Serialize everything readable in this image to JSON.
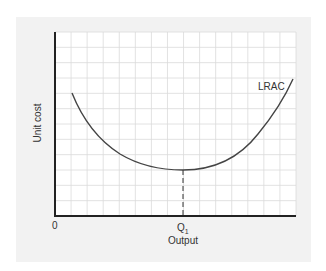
{
  "chart_data": {
    "type": "line",
    "title": "",
    "xlabel": "Output",
    "ylabel": "Unit cost",
    "origin_label": "0",
    "x_tick_labels": [
      {
        "label": "Q",
        "subscript": "1",
        "position": "minimum of LRAC"
      }
    ],
    "grid": true,
    "legend": "none",
    "series": [
      {
        "name": "LRAC",
        "shape": "U-shaped curve",
        "points_normalized": [
          {
            "x": 0.07,
            "y": 0.8
          },
          {
            "x": 0.14,
            "y": 0.62
          },
          {
            "x": 0.2,
            "y": 0.49
          },
          {
            "x": 0.29,
            "y": 0.38
          },
          {
            "x": 0.39,
            "y": 0.32
          },
          {
            "x": 0.53,
            "y": 0.3
          },
          {
            "x": 0.66,
            "y": 0.34
          },
          {
            "x": 0.77,
            "y": 0.43
          },
          {
            "x": 0.85,
            "y": 0.56
          },
          {
            "x": 0.93,
            "y": 0.73
          },
          {
            "x": 0.98,
            "y": 0.9
          }
        ]
      }
    ],
    "annotations": [
      {
        "type": "dashed-vertical",
        "x_label": "Q1",
        "from": "x-axis",
        "to": "LRAC minimum"
      }
    ],
    "xlim": [
      0,
      1
    ],
    "ylim": [
      0,
      1
    ]
  },
  "labels": {
    "origin": "0",
    "x_axis": "Output",
    "y_axis": "Unit cost",
    "curve": "LRAC",
    "q_main": "Q",
    "q_sub": "1"
  },
  "colors": {
    "panel": "#f2f2f2",
    "grid": "#d9d9d9",
    "axis": "#222222",
    "curve": "#444444"
  }
}
